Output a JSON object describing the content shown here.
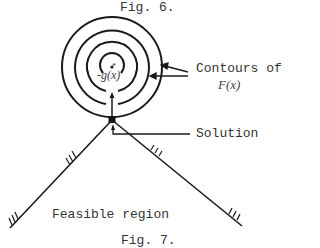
{
  "figure": {
    "top_caption": "Fig. 6.",
    "bottom_caption": "Fig. 7."
  },
  "labels": {
    "contours_line1": "Contours of",
    "contours_line2": "F(x)",
    "gradient": "-g(x*)",
    "gradient_prefix": "-g(",
    "gradient_var": "x",
    "gradient_star": "*",
    "gradient_suffix": ")",
    "solution": "Solution",
    "feasible_region": "Feasible region"
  },
  "colors": {
    "ink": "#1a1a1a",
    "text": "#333333",
    "background": "#ffffff"
  }
}
